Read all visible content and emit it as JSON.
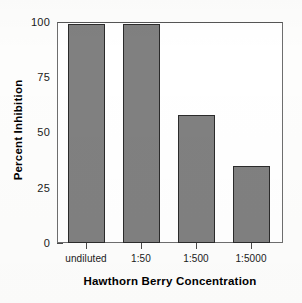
{
  "chart_data": {
    "type": "bar",
    "title": "",
    "subtitle": "",
    "xlabel": "Hawthorn Berry Concentration",
    "ylabel": "Percent Inhibition",
    "categories": [
      "undiluted",
      "1:50",
      "1:500",
      "1:5000"
    ],
    "values": [
      99,
      99,
      58,
      35
    ],
    "series": [
      {
        "name": "Percent Inhibition",
        "values": [
          99,
          99,
          58,
          35
        ]
      }
    ],
    "ylim": [
      0,
      100
    ],
    "yticks": [
      0,
      25,
      50,
      75,
      100
    ],
    "ytick_labels": [
      "0",
      "25",
      "50",
      "75",
      "100"
    ],
    "xtick_labels": [
      "undiluted",
      "1:50",
      "1:500",
      "1:5000"
    ],
    "grid": false,
    "legend": false,
    "legend_position": "none",
    "bar_fill_color": "#808080",
    "bar_edge_color": "#2b2b2b",
    "axis_color": "#4a4a4a",
    "plot_background": "#ffffff",
    "figure_background": "#fdfdfc",
    "annotations": []
  }
}
